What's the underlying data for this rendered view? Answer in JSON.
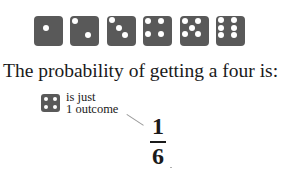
{
  "dice": [
    {
      "face": 1,
      "pips": [
        [
          11.5,
          12
        ]
      ]
    },
    {
      "face": 2,
      "pips": [
        [
          5,
          5
        ],
        [
          18,
          19
        ]
      ]
    },
    {
      "face": 3,
      "pips": [
        [
          5,
          4
        ],
        [
          11.5,
          12
        ],
        [
          18,
          19
        ]
      ]
    },
    {
      "face": 4,
      "pips": [
        [
          5,
          5
        ],
        [
          18,
          5
        ],
        [
          5,
          18
        ],
        [
          18,
          18
        ]
      ]
    },
    {
      "face": 5,
      "pips": [
        [
          5,
          5
        ],
        [
          18,
          5
        ],
        [
          11.5,
          11.5
        ],
        [
          5,
          18
        ],
        [
          18,
          18
        ]
      ]
    },
    {
      "face": 6,
      "pips": [
        [
          5,
          4
        ],
        [
          18,
          4
        ],
        [
          5,
          11.5
        ],
        [
          18,
          11.5
        ],
        [
          5,
          19
        ],
        [
          18,
          19
        ]
      ]
    }
  ],
  "dice_colors": {
    "face": "#595959",
    "pip": "#ffffff"
  },
  "headline": "The probability of getting a four is:",
  "annotation": {
    "line1": "is just",
    "line2": "1 outcome",
    "icon": "die-face-four"
  },
  "fraction": {
    "numerator": "1",
    "denominator": "6"
  }
}
